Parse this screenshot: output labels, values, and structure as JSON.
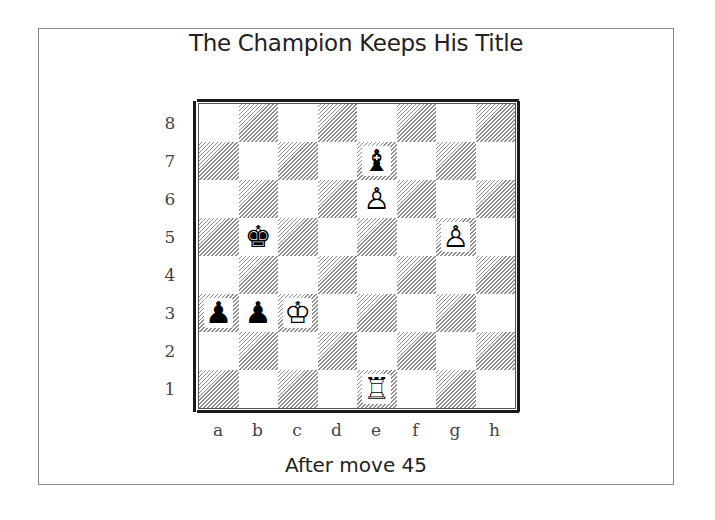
{
  "title": "The Champion Keeps His Title",
  "caption": "After move 45",
  "colors": {
    "frame_border": "#8a8a8a",
    "board_border": "#1a1a1a",
    "hatch": "#8f8f8f",
    "text": "#222222"
  },
  "board": {
    "ranks": [
      "8",
      "7",
      "6",
      "5",
      "4",
      "3",
      "2",
      "1"
    ],
    "files": [
      "a",
      "b",
      "c",
      "d",
      "e",
      "f",
      "g",
      "h"
    ],
    "pieces": [
      {
        "square": "e7",
        "piece": "black-bishop",
        "glyph": "♝"
      },
      {
        "square": "e6",
        "piece": "white-pawn",
        "glyph": "♙"
      },
      {
        "square": "b5",
        "piece": "black-king",
        "glyph": "♚"
      },
      {
        "square": "g5",
        "piece": "white-pawn",
        "glyph": "♙"
      },
      {
        "square": "a3",
        "piece": "black-pawn",
        "glyph": "♟"
      },
      {
        "square": "b3",
        "piece": "black-pawn",
        "glyph": "♟"
      },
      {
        "square": "c3",
        "piece": "white-king",
        "glyph": "♔"
      },
      {
        "square": "e1",
        "piece": "white-rook",
        "glyph": "♖"
      }
    ]
  }
}
